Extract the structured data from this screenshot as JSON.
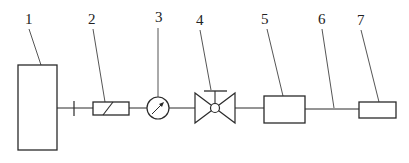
{
  "diagram": {
    "type": "schematic-flow-line",
    "colors": {
      "line": "#2a2a2a",
      "background": "#ffffff",
      "text": "#222222"
    },
    "labels": [
      {
        "id": "1",
        "text": "1",
        "x": 25,
        "y": 24
      },
      {
        "id": "2",
        "text": "2",
        "x": 88,
        "y": 24
      },
      {
        "id": "3",
        "text": "3",
        "x": 155,
        "y": 22
      },
      {
        "id": "4",
        "text": "4",
        "x": 196,
        "y": 25
      },
      {
        "id": "5",
        "text": "5",
        "x": 261,
        "y": 24
      },
      {
        "id": "6",
        "text": "6",
        "x": 318,
        "y": 24
      },
      {
        "id": "7",
        "text": "7",
        "x": 357,
        "y": 25
      }
    ],
    "components": [
      {
        "number": "1",
        "shape": "tall-rectangle"
      },
      {
        "number": "2",
        "shape": "rectangle-with-diagonal"
      },
      {
        "number": "3",
        "shape": "gauge-circle-with-needle"
      },
      {
        "number": "4",
        "shape": "gate-valve-with-stem"
      },
      {
        "number": "5",
        "shape": "rectangle"
      },
      {
        "number": "6",
        "shape": "pipe-line"
      },
      {
        "number": "7",
        "shape": "small-rectangle"
      }
    ]
  }
}
